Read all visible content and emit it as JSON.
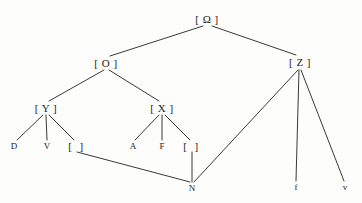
{
  "figure": {
    "name": "syntax-tree-diagram",
    "width": 362,
    "height": 203,
    "background_color": "#fdfdfb",
    "ink_color": "#232323"
  },
  "nodes": [
    {
      "id": "omega",
      "label": "[ Ω ]",
      "kind": "bracketed",
      "x": 207,
      "y": 19
    },
    {
      "id": "o",
      "label": "[ O ]",
      "kind": "bracketed",
      "x": 106,
      "y": 63
    },
    {
      "id": "z",
      "label": "[ Z ]",
      "kind": "bracketed",
      "x": 300,
      "y": 62
    },
    {
      "id": "y",
      "label": "[ Y ]",
      "kind": "bracketed",
      "x": 46,
      "y": 108
    },
    {
      "id": "x",
      "label": "[ X ]",
      "kind": "bracketed",
      "x": 162,
      "y": 108
    },
    {
      "id": "d",
      "label": "D",
      "kind": "terminal",
      "x": 14,
      "y": 146
    },
    {
      "id": "v",
      "label": "V",
      "kind": "terminal",
      "x": 47,
      "y": 146
    },
    {
      "id": "gap1",
      "label": "[  ]",
      "kind": "empty-bracket",
      "x": 77,
      "y": 146
    },
    {
      "id": "a",
      "label": "A",
      "kind": "terminal",
      "x": 133,
      "y": 146
    },
    {
      "id": "f_cap",
      "label": "F",
      "kind": "terminal",
      "x": 162,
      "y": 146
    },
    {
      "id": "gap2",
      "label": "[  ]",
      "kind": "empty-bracket",
      "x": 192,
      "y": 146
    },
    {
      "id": "n",
      "label": "N",
      "kind": "terminal",
      "x": 192,
      "y": 188
    },
    {
      "id": "f_low",
      "label": "f",
      "kind": "terminal-lc",
      "x": 296,
      "y": 187
    },
    {
      "id": "v_low",
      "label": "v",
      "kind": "terminal-lc",
      "x": 345,
      "y": 187
    }
  ],
  "edges": [
    {
      "id": "omega-o",
      "from": "omega",
      "to": "o",
      "x1": 203,
      "y1": 26,
      "x2": 110,
      "y2": 56
    },
    {
      "id": "omega-z",
      "from": "omega",
      "to": "z",
      "x1": 212,
      "y1": 26,
      "x2": 296,
      "y2": 55
    },
    {
      "id": "o-y",
      "from": "o",
      "to": "y",
      "x1": 104,
      "y1": 70,
      "x2": 49,
      "y2": 101
    },
    {
      "id": "o-x",
      "from": "o",
      "to": "x",
      "x1": 109,
      "y1": 70,
      "x2": 159,
      "y2": 101
    },
    {
      "id": "y-d",
      "from": "y",
      "to": "d",
      "x1": 43,
      "y1": 115,
      "x2": 17,
      "y2": 140
    },
    {
      "id": "y-v",
      "from": "y",
      "to": "v",
      "x1": 46,
      "y1": 115,
      "x2": 47,
      "y2": 140
    },
    {
      "id": "y-gap1",
      "from": "y",
      "to": "gap1",
      "x1": 49,
      "y1": 115,
      "x2": 74,
      "y2": 140
    },
    {
      "id": "x-a",
      "from": "x",
      "to": "a",
      "x1": 159,
      "y1": 115,
      "x2": 135,
      "y2": 140
    },
    {
      "id": "x-f",
      "from": "x",
      "to": "f_cap",
      "x1": 162,
      "y1": 115,
      "x2": 162,
      "y2": 140
    },
    {
      "id": "x-gap2",
      "from": "x",
      "to": "gap2",
      "x1": 165,
      "y1": 115,
      "x2": 190,
      "y2": 140
    },
    {
      "id": "gap1-n",
      "from": "gap1",
      "to": "n",
      "x1": 77,
      "y1": 152,
      "x2": 190,
      "y2": 182
    },
    {
      "id": "gap2-n",
      "from": "gap2",
      "to": "n",
      "x1": 192,
      "y1": 152,
      "x2": 192,
      "y2": 182
    },
    {
      "id": "z-n",
      "from": "z",
      "to": "n",
      "x1": 298,
      "y1": 70,
      "x2": 194,
      "y2": 182
    },
    {
      "id": "z-flow",
      "from": "z",
      "to": "f_low",
      "x1": 299,
      "y1": 70,
      "x2": 296,
      "y2": 181
    },
    {
      "id": "z-vlow",
      "from": "z",
      "to": "v_low",
      "x1": 301,
      "y1": 70,
      "x2": 344,
      "y2": 181
    }
  ]
}
